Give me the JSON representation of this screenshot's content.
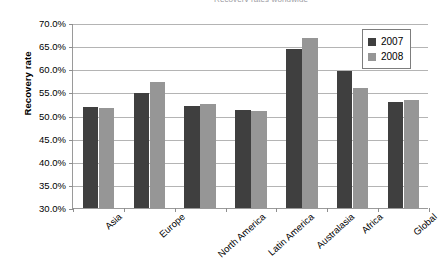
{
  "chart_data": {
    "type": "bar",
    "title": "Recovery rates worldwide",
    "title_clipped": true,
    "xlabel": "",
    "ylabel": "Recovery rate",
    "ylim": [
      30.0,
      70.0
    ],
    "ytick_step": 5.0,
    "ytick_labels": [
      "70.0%",
      "65.0%",
      "60.0%",
      "55.0%",
      "50.0%",
      "45.0%",
      "40.0%",
      "35.0%",
      "30.0%"
    ],
    "ytick_values": [
      70.0,
      65.0,
      60.0,
      55.0,
      50.0,
      45.0,
      40.0,
      35.0,
      30.0
    ],
    "grid": "horizontal",
    "legend_position": "top-right-inside",
    "categories": [
      "Asia",
      "Europe",
      "North America",
      "Latin America",
      "Australasia",
      "Africa",
      "Global"
    ],
    "series": [
      {
        "name": "2007",
        "color": "#3f3f3f",
        "values": [
          51.8,
          54.9,
          52.0,
          51.2,
          64.3,
          59.7,
          53.0
        ]
      },
      {
        "name": "2008",
        "color": "#969696",
        "values": [
          51.6,
          57.2,
          52.5,
          51.0,
          66.7,
          56.0,
          53.4
        ]
      }
    ]
  }
}
